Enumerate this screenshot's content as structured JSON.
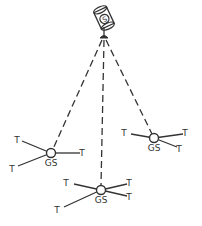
{
  "diagram": {
    "type": "satellite-ground-station-network",
    "satellite": {
      "label": "S",
      "cx": 104,
      "cy": 18
    },
    "colors": {
      "stroke": "#333333",
      "background": "#ffffff"
    },
    "ground_stations": [
      {
        "id": "left",
        "label": "GS",
        "cx": 51,
        "cy": 153,
        "terminals": [
          {
            "label": "T",
            "x": 22,
            "y": 141,
            "lx": 17,
            "ly": 143
          },
          {
            "label": "T",
            "x": 80,
            "y": 153,
            "lx": 82,
            "ly": 156
          },
          {
            "label": "T",
            "x": 18,
            "y": 166,
            "lx": 12,
            "ly": 172
          }
        ]
      },
      {
        "id": "right",
        "label": "GS",
        "cx": 154,
        "cy": 138,
        "terminals": [
          {
            "label": "T",
            "x": 131,
            "y": 134,
            "lx": 124,
            "ly": 136
          },
          {
            "label": "T",
            "x": 183,
            "y": 134,
            "lx": 185,
            "ly": 136
          },
          {
            "label": "T",
            "x": 177,
            "y": 147,
            "lx": 179,
            "ly": 152
          }
        ]
      },
      {
        "id": "bottom",
        "label": "GS",
        "cx": 101,
        "cy": 190,
        "terminals": [
          {
            "label": "T",
            "x": 74,
            "y": 184,
            "lx": 66,
            "ly": 186
          },
          {
            "label": "T",
            "x": 127,
            "y": 184,
            "lx": 129,
            "ly": 186
          },
          {
            "label": "T",
            "x": 127,
            "y": 196,
            "lx": 129,
            "ly": 200
          },
          {
            "label": "T",
            "x": 64,
            "y": 207,
            "lx": 57,
            "ly": 213
          }
        ]
      }
    ],
    "uplinks": [
      {
        "to": "left",
        "style": "dashed"
      },
      {
        "to": "bottom",
        "style": "dashed"
      },
      {
        "to": "right",
        "style": "dashed"
      }
    ]
  }
}
